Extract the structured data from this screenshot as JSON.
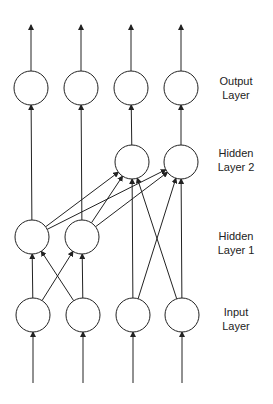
{
  "diagram": {
    "colors": {
      "stroke": "#222222",
      "node_fill": "#ffffff",
      "label": "#222222",
      "background": "#ffffff"
    },
    "node_radius": 17,
    "layers": [
      {
        "id": "output",
        "label_line1": "Output",
        "label_line2": "Layer",
        "label_y": 81,
        "nodes": [
          {
            "x": 31,
            "y": 88
          },
          {
            "x": 81,
            "y": 88
          },
          {
            "x": 131,
            "y": 88
          },
          {
            "x": 181,
            "y": 88
          }
        ]
      },
      {
        "id": "hidden2",
        "label_line1": "Hidden",
        "label_line2": "Layer 2",
        "label_y": 153,
        "nodes": [
          {
            "x": 132,
            "y": 162
          },
          {
            "x": 181,
            "y": 162
          }
        ]
      },
      {
        "id": "hidden1",
        "label_line1": "Hidden",
        "label_line2": "Layer 1",
        "label_y": 236,
        "nodes": [
          {
            "x": 32,
            "y": 237
          },
          {
            "x": 82,
            "y": 237
          }
        ]
      },
      {
        "id": "input",
        "label_line1": "Input",
        "label_line2": "Layer",
        "label_y": 312,
        "nodes": [
          {
            "x": 33,
            "y": 315
          },
          {
            "x": 83,
            "y": 315
          },
          {
            "x": 133,
            "y": 315
          },
          {
            "x": 182,
            "y": 315
          }
        ]
      }
    ],
    "edges": [
      {
        "from": [
          "input",
          0
        ],
        "to": [
          "hidden1",
          0
        ]
      },
      {
        "from": [
          "input",
          0
        ],
        "to": [
          "hidden1",
          1
        ]
      },
      {
        "from": [
          "input",
          1
        ],
        "to": [
          "hidden1",
          0
        ]
      },
      {
        "from": [
          "input",
          1
        ],
        "to": [
          "hidden1",
          1
        ]
      },
      {
        "from": [
          "input",
          2
        ],
        "to": [
          "hidden2",
          0
        ]
      },
      {
        "from": [
          "input",
          2
        ],
        "to": [
          "hidden2",
          1
        ]
      },
      {
        "from": [
          "input",
          3
        ],
        "to": [
          "hidden2",
          0
        ]
      },
      {
        "from": [
          "input",
          3
        ],
        "to": [
          "hidden2",
          1
        ]
      },
      {
        "from": [
          "hidden1",
          0
        ],
        "to": [
          "hidden2",
          0
        ]
      },
      {
        "from": [
          "hidden1",
          0
        ],
        "to": [
          "hidden2",
          1
        ]
      },
      {
        "from": [
          "hidden1",
          1
        ],
        "to": [
          "hidden2",
          0
        ]
      },
      {
        "from": [
          "hidden1",
          1
        ],
        "to": [
          "hidden2",
          1
        ]
      },
      {
        "from": [
          "hidden1",
          0
        ],
        "to": [
          "output",
          0
        ]
      },
      {
        "from": [
          "hidden1",
          1
        ],
        "to": [
          "output",
          1
        ]
      },
      {
        "from": [
          "hidden2",
          0
        ],
        "to": [
          "output",
          2
        ]
      },
      {
        "from": [
          "hidden2",
          1
        ],
        "to": [
          "output",
          3
        ]
      }
    ],
    "input_arrows_from_y": 383,
    "output_arrows_to_y": 25
  }
}
